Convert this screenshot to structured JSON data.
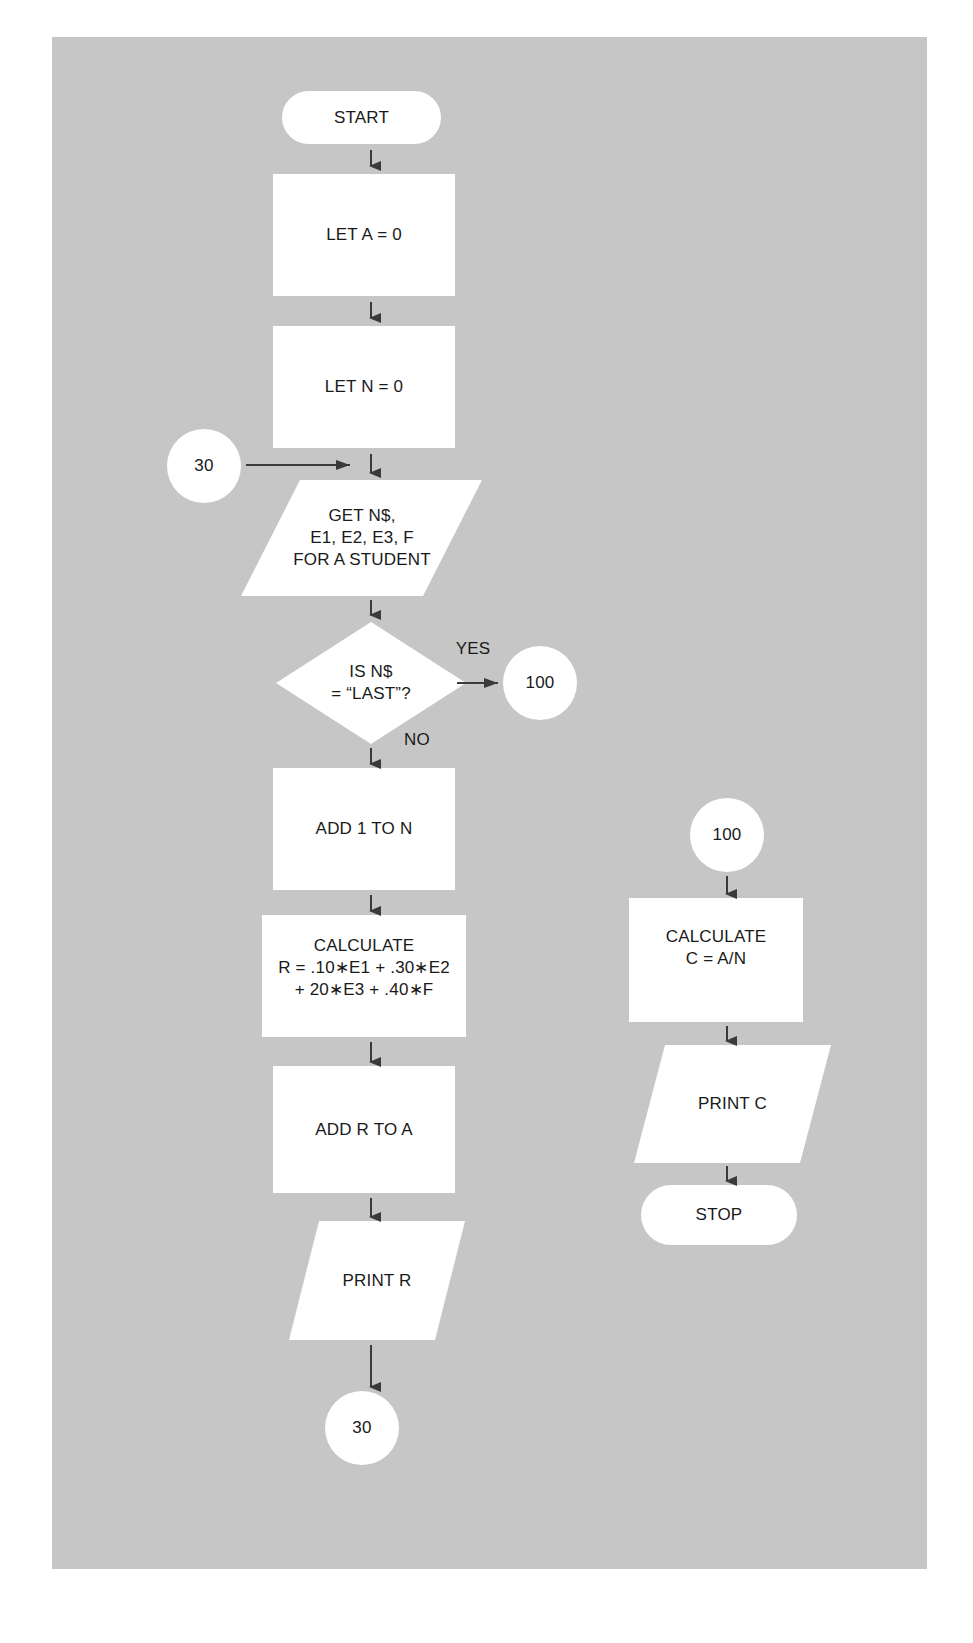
{
  "colors": {
    "panel": "#c6c6c6",
    "shape_fill": "#ffffff",
    "arrow": "#3a3a3a",
    "text": "#1a1a1a"
  },
  "flowchart": {
    "main": {
      "start": "START",
      "let_a": "LET A = 0",
      "let_n": "LET N = 0",
      "connector_in": "30",
      "input": "GET N$,\nE1, E2, E3, F\nFOR A STUDENT",
      "decision": "IS N$\n= “LAST”?",
      "decision_yes": "YES",
      "decision_no": "NO",
      "connector_yes": "100",
      "add_n": "ADD 1 TO N",
      "calc_r": "CALCULATE\nR = .10∗E1 + .30∗E2\n+ 20∗E3 + .40∗F",
      "add_r": "ADD R TO A",
      "print_r": "PRINT R",
      "connector_loop": "30"
    },
    "branch": {
      "connector": "100",
      "calc_c": "CALCULATE\nC = A/N",
      "print_c": "PRINT C",
      "stop": "STOP"
    }
  }
}
